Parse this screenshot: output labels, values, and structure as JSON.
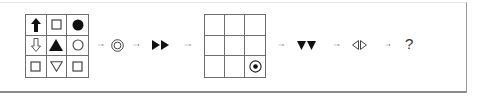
{
  "puzzle": {
    "description": "Symbol transformation sequence puzzle",
    "grid1": {
      "rows": [
        [
          "up-arrow-filled",
          "square-outline",
          "circle-filled"
        ],
        [
          "down-arrow-outline",
          "triangle-up-filled",
          "circle-outline"
        ],
        [
          "square-outline",
          "triangle-down-outline",
          "square-outline"
        ]
      ]
    },
    "sequence": [
      {
        "type": "arrow"
      },
      {
        "type": "symbol",
        "name": "double-circle"
      },
      {
        "type": "arrow"
      },
      {
        "type": "symbol",
        "name": "two-right-triangles-filled"
      },
      {
        "type": "arrow"
      },
      {
        "type": "grid2"
      },
      {
        "type": "arrow"
      },
      {
        "type": "symbol",
        "name": "two-down-triangles-filled"
      },
      {
        "type": "arrow"
      },
      {
        "type": "symbol",
        "name": "left-right-triangles-outline"
      },
      {
        "type": "arrow"
      },
      {
        "type": "text",
        "value": "?"
      }
    ],
    "grid2": {
      "rows": [
        [
          "",
          "",
          ""
        ],
        [
          "",
          "",
          ""
        ],
        [
          "",
          "",
          "dotted-circle"
        ]
      ]
    },
    "question_mark": "?"
  },
  "colors": {
    "ink": "#111111",
    "grid_line": "#6e6e6e",
    "outline": "#444444",
    "arrow": "#555555"
  }
}
